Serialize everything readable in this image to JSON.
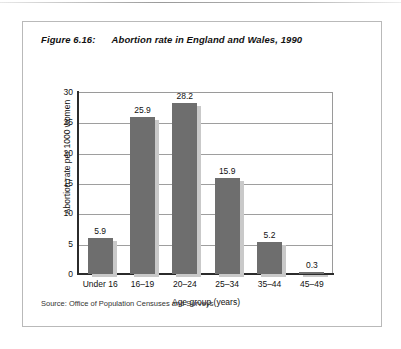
{
  "figure": {
    "number_label": "Figure 6.16:",
    "title": "Abortion rate in England and Wales, 1990",
    "source": "Source: Office of Population Censuses and Surveys"
  },
  "chart_data": {
    "type": "bar",
    "title": "Abortion rate in England and Wales, 1990",
    "categories": [
      "Under 16",
      "16–19",
      "20–24",
      "25–34",
      "35–44",
      "45–49"
    ],
    "values": [
      5.9,
      25.9,
      28.2,
      15.9,
      5.2,
      0.3
    ],
    "value_labels": [
      "5.9",
      "25.9",
      "28.2",
      "15.9",
      "5.2",
      "0.3"
    ],
    "xlabel": "Age group (years)",
    "ylabel": "Abortion rate per 1000 women",
    "ylim": [
      0,
      30
    ],
    "yticks": [
      0,
      5,
      10,
      15,
      20,
      25,
      30
    ],
    "ytick_labels": [
      "0",
      "5",
      "10",
      "15",
      "20",
      "25",
      "30"
    ],
    "grid": "horizontal",
    "legend": "none",
    "bar_color": "#6e6e6e",
    "shadow_color": "#c9c9c9",
    "gridline_color": "#9e9e9e",
    "axis_color": "#2b2b2b",
    "frame_color": "#b9b9b9"
  }
}
